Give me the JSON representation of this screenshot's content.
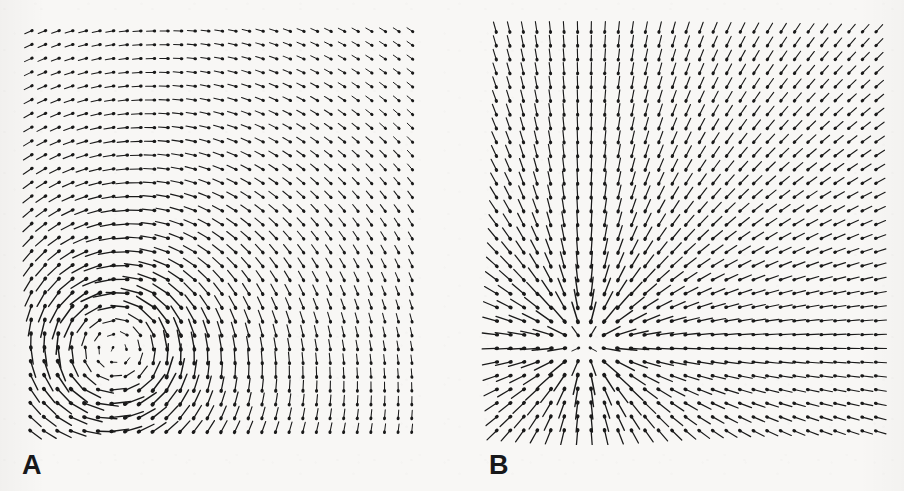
{
  "figure": {
    "background_color": "#f8f7f5",
    "ink_color": "#1a1a1a",
    "width": 904,
    "height": 491
  },
  "panels": [
    {
      "label": "A",
      "label_x": 22,
      "label_y": 452,
      "name": "vortex-panel",
      "description": "Vector field showing a rotational vortex (counter-clockwise swirl) with the singular point in the lower-left quadrant.",
      "plot": {
        "x": 14,
        "y": 14,
        "width": 420,
        "height": 430
      }
    },
    {
      "label": "B",
      "label_x": 489,
      "label_y": 452,
      "name": "source-panel",
      "description": "Vector field showing a radial source / star node with arrows emanating outward from a singular point left of centre.",
      "plot": {
        "x": 478,
        "y": 14,
        "width": 420,
        "height": 430
      }
    }
  ],
  "chart_data": [
    {
      "type": "quiver",
      "panel": "A",
      "title": "",
      "xlabel": "",
      "ylabel": "",
      "grid": false,
      "legend": null,
      "field_type": "vortex",
      "rotation": "counter-clockwise",
      "grid_columns": 29,
      "grid_rows": 30,
      "grid_x0": 31,
      "grid_y0": 31,
      "grid_dx": 13.6,
      "grid_dy": 13.8,
      "singular_point": {
        "x": 115,
        "y": 350
      },
      "core_radius": 58,
      "max_arrow_length": 20,
      "xlim": [
        -1.0,
        1.0
      ],
      "ylim": [
        -1.0,
        1.0
      ],
      "annotations": [
        "A"
      ]
    },
    {
      "type": "quiver",
      "panel": "B",
      "title": "",
      "xlabel": "",
      "ylabel": "",
      "grid": false,
      "legend": null,
      "field_type": "radial-source",
      "rotation": "none",
      "grid_columns": 29,
      "grid_rows": 30,
      "grid_x0": 496,
      "grid_y0": 31,
      "grid_dx": 13.6,
      "grid_dy": 13.8,
      "singular_point": {
        "x": 585,
        "y": 345
      },
      "core_radius": 26,
      "max_arrow_length": 20,
      "xlim": [
        -1.0,
        1.0
      ],
      "ylim": [
        -1.0,
        1.0
      ],
      "annotations": [
        "B"
      ]
    }
  ]
}
